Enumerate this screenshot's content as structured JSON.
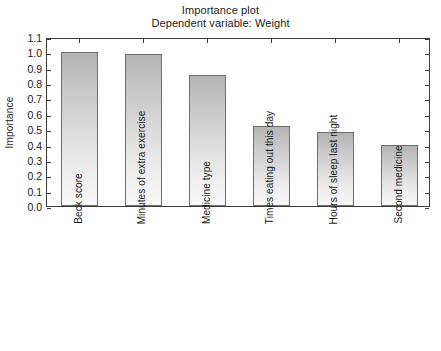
{
  "chart_data": {
    "type": "bar",
    "title": "Importance plot",
    "subtitle": "Dependent variable: Weight",
    "xlabel": "",
    "ylabel": "Importance",
    "ylim": [
      0.0,
      1.1
    ],
    "ytick_labels": [
      "1.1",
      "1.0",
      "0.9",
      "0.8",
      "0.7",
      "0.6",
      "0.5",
      "0.4",
      "0.3",
      "0.2",
      "0.1",
      "0.0"
    ],
    "ytick_values": [
      1.1,
      1.0,
      0.9,
      0.8,
      0.7,
      0.6,
      0.5,
      0.4,
      0.3,
      0.2,
      0.1,
      0.0
    ],
    "grid": false,
    "legend": null,
    "categories": [
      "Beck score",
      "Minutes of extra exercise",
      "Medicine type",
      "Times eating out this day",
      "Hours of sleep last night",
      "Second medicine"
    ],
    "values": [
      1.0,
      0.99,
      0.855,
      0.52,
      0.48,
      0.4
    ],
    "bar_gradient_top_color": "#b4b4b4",
    "bar_gradient_bottom_color": "#f8f8f8",
    "bar_border_color": "#6e6e6e",
    "axis_color": "#3d3d3d",
    "background_color": "#ffffff"
  }
}
